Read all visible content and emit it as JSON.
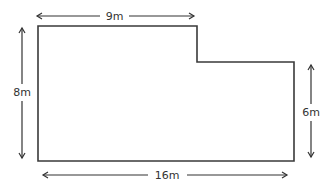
{
  "diagram": {
    "type": "L-shaped floor plan",
    "colors": {
      "outline": "#3a3a3a",
      "arrow": "#333333",
      "label": "#333333",
      "background": "#ffffff"
    },
    "shape": {
      "name": "l-shape-outline",
      "vertices": [
        [
          38,
          26
        ],
        [
          197,
          26
        ],
        [
          197,
          62
        ],
        [
          294,
          62
        ],
        [
          294,
          161
        ],
        [
          38,
          161
        ]
      ]
    },
    "dimensions": {
      "top": {
        "label": "9m",
        "value": 9,
        "unit": "m",
        "edge": "top notch width"
      },
      "left": {
        "label": "8m",
        "value": 8,
        "unit": "m",
        "edge": "full height"
      },
      "right": {
        "label": "6m",
        "value": 6,
        "unit": "m",
        "edge": "right side height"
      },
      "bottom": {
        "label": "16m",
        "value": 16,
        "unit": "m",
        "edge": "full width"
      }
    }
  }
}
